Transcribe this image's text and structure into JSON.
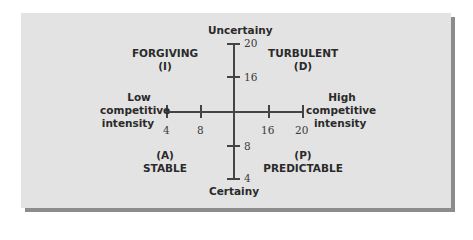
{
  "diagram": {
    "vertical_axis": {
      "top_label": "Uncertainy",
      "bottom_label": "Certainy",
      "ticks": [
        "20",
        "16",
        "8",
        "4"
      ]
    },
    "horizontal_axis": {
      "left_label_lines": [
        "Low",
        "competitive",
        "intensity"
      ],
      "right_label_lines": [
        "High",
        "competitive",
        "intensity"
      ],
      "ticks": [
        "4",
        "8",
        "16",
        "20"
      ]
    },
    "quadrants": {
      "top_left": {
        "name": "FORGIVING",
        "code": "(I)"
      },
      "top_right": {
        "name": "TURBULENT",
        "code": "(D)"
      },
      "bottom_left": {
        "name": "STABLE",
        "code": "(A)"
      },
      "bottom_right": {
        "name": "PREDICTABLE",
        "code": "(P)"
      }
    }
  },
  "colors": {
    "panel": "#e3e3e3",
    "shadow": "#8c8c8c",
    "axis": "#444444",
    "text": "#2a2a2a"
  }
}
